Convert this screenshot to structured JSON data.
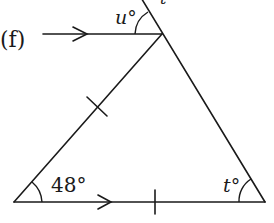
{
  "diagram": {
    "part_label": "(f)",
    "angle_labels": {
      "top": "u°",
      "bottom_left": "48°",
      "bottom_right": "t°"
    },
    "cut_off_top_label": "t",
    "features": {
      "parallel_arrows": 2,
      "equal_length_ticks": 2
    },
    "colors": {
      "stroke": "#1a1a1a",
      "background": "#ffffff"
    }
  }
}
